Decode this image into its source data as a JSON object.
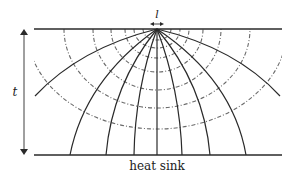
{
  "diagram": {
    "type": "heat-spreading-field-lines",
    "labels": {
      "source_width": "l",
      "thickness": "t",
      "bottom": "heat sink"
    },
    "colors": {
      "line": "#2a2a2a",
      "dashed": "#6a6a6a",
      "background": "#ffffff"
    },
    "geometry": {
      "top_surface_y": 29,
      "bottom_surface_y": 155,
      "surface_x_start": 34,
      "surface_x_end": 282,
      "source_center_x": 157,
      "thickness_arrow_x": 24
    },
    "heat_flow_lines_end_x": [
      70,
      106,
      134,
      157,
      182,
      210,
      246
    ],
    "side_flow_lines": [
      {
        "end": [
          35,
          96
        ]
      },
      {
        "end": [
          280,
          96
        ]
      }
    ],
    "isotherms": [
      {
        "rx": 14,
        "bottom_y": 40
      },
      {
        "rx": 23,
        "bottom_y": 48
      },
      {
        "rx": 32,
        "bottom_y": 58
      },
      {
        "rx": 46,
        "bottom_y": 72
      },
      {
        "rx": 64,
        "bottom_y": 90
      },
      {
        "rx": 93,
        "bottom_y": 108
      },
      {
        "rx": 130,
        "bottom_y": 129
      }
    ]
  }
}
